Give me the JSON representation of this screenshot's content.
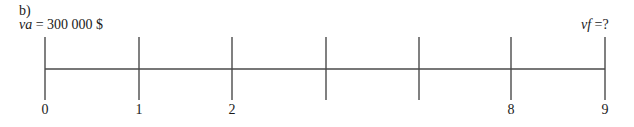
{
  "figure": {
    "part_label": "b)",
    "present_value": {
      "var": "va",
      "text": " = 300 000 $"
    },
    "future_value": {
      "var": "vf",
      "text": " =?"
    },
    "colors": {
      "line": "#4a4a4a",
      "text": "#1a1a1a",
      "background": "#ffffff"
    },
    "timeline": {
      "ticks": [
        {
          "x": 45,
          "label": "0"
        },
        {
          "x": 139,
          "label": "1"
        },
        {
          "x": 232,
          "label": "2"
        },
        {
          "x": 326,
          "label": ""
        },
        {
          "x": 419,
          "label": ""
        },
        {
          "x": 511,
          "label": "8"
        },
        {
          "x": 605,
          "label": "9"
        }
      ]
    }
  }
}
